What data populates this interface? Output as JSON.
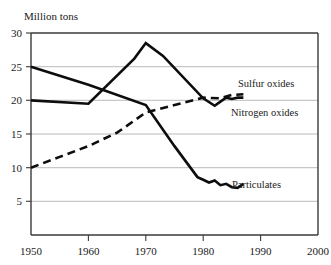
{
  "figure": {
    "y_axis_title": "Million tons",
    "background_color": "#ffffff",
    "line_color": "#0d0d0d",
    "grid_color": "#a8a8a8",
    "frame_color": "#3a3a3a"
  },
  "labels": {
    "sulfur": "Sulfur oxides",
    "nitrogen": "Nitrogen oxides",
    "particulates": "Particulates"
  },
  "chart_data": {
    "type": "line",
    "title": "",
    "subtitle": "",
    "xlabel": "",
    "ylabel": "Million tons",
    "xlim": [
      1950,
      2000
    ],
    "ylim": [
      0,
      30
    ],
    "xticks": [
      1950,
      1960,
      1970,
      1980,
      1990,
      2000
    ],
    "xtick_labels": [
      "1950",
      "1960",
      "1970",
      "1980",
      "1990",
      "2000"
    ],
    "yticks": [
      5,
      10,
      15,
      20,
      25,
      30
    ],
    "ytick_labels": [
      "5",
      "10",
      "15",
      "20",
      "25",
      "30"
    ],
    "grid": "horizontal",
    "legend_position": "inline-right-of-line-ends",
    "series": [
      {
        "name": "Sulfur oxides",
        "style": "solid",
        "label_x": 1990,
        "label_y": 23.2,
        "x": [
          1950,
          1960,
          1968,
          1970,
          1973,
          1980,
          1982,
          1983,
          1984,
          1985,
          1986,
          1987
        ],
        "y": [
          20.0,
          19.5,
          26.2,
          28.5,
          26.6,
          20.3,
          19.2,
          19.8,
          20.4,
          20.2,
          20.4,
          20.4
        ]
      },
      {
        "name": "Nitrogen oxides",
        "style": "dashed",
        "label_x": 1990,
        "label_y": 19.0,
        "x": [
          1950,
          1955,
          1960,
          1965,
          1970,
          1975,
          1980,
          1983,
          1985,
          1987
        ],
        "y": [
          10.0,
          11.6,
          13.2,
          15.2,
          18.2,
          19.3,
          20.4,
          20.3,
          20.8,
          20.9
        ]
      },
      {
        "name": "Particulates",
        "style": "solid",
        "label_x": 1989,
        "label_y": 7.6,
        "x": [
          1950,
          1960,
          1970,
          1975,
          1979,
          1980,
          1981,
          1982,
          1983,
          1984,
          1985,
          1986,
          1987
        ],
        "y": [
          25.0,
          22.3,
          19.3,
          13.2,
          8.6,
          8.2,
          7.8,
          8.1,
          7.4,
          7.6,
          7.1,
          7.0,
          7.6
        ]
      }
    ]
  }
}
